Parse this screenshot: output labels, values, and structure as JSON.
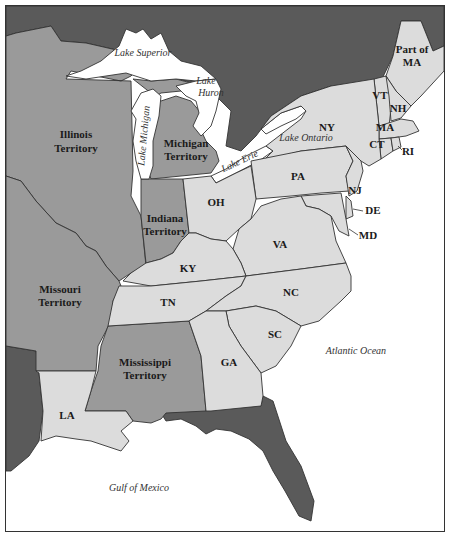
{
  "map": {
    "colors": {
      "foreign": "#5a5a5a",
      "territory": "#9a9a9a",
      "state": "#dcdcdc",
      "water": "#ffffff",
      "border": "#333333"
    },
    "territories": [
      {
        "id": "illinois",
        "label_line1": "Illinois",
        "label_line2": "Territory"
      },
      {
        "id": "michigan",
        "label_line1": "Michigan",
        "label_line2": "Territory"
      },
      {
        "id": "indiana",
        "label_line1": "Indiana",
        "label_line2": "Territory"
      },
      {
        "id": "missouri",
        "label_line1": "Missouri",
        "label_line2": "Territory"
      },
      {
        "id": "mississippi",
        "label_line1": "Mississippi",
        "label_line2": "Territory"
      }
    ],
    "states": [
      {
        "id": "maine",
        "label_line1": "Part of",
        "label_line2": "MA"
      },
      {
        "id": "vt",
        "label": "VT"
      },
      {
        "id": "nh",
        "label": "NH"
      },
      {
        "id": "ma",
        "label": "MA"
      },
      {
        "id": "ct",
        "label": "CT"
      },
      {
        "id": "ri",
        "label": "RI"
      },
      {
        "id": "ny",
        "label": "NY"
      },
      {
        "id": "pa",
        "label": "PA"
      },
      {
        "id": "nj",
        "label": "NJ"
      },
      {
        "id": "de",
        "label": "DE"
      },
      {
        "id": "md",
        "label": "MD"
      },
      {
        "id": "oh",
        "label": "OH"
      },
      {
        "id": "va",
        "label": "VA"
      },
      {
        "id": "ky",
        "label": "KY"
      },
      {
        "id": "tn",
        "label": "TN"
      },
      {
        "id": "nc",
        "label": "NC"
      },
      {
        "id": "sc",
        "label": "SC"
      },
      {
        "id": "ga",
        "label": "GA"
      },
      {
        "id": "la",
        "label": "LA"
      }
    ],
    "water_labels": {
      "lake_superior": "Lake Superior",
      "lake_huron_1": "Lake",
      "lake_huron_2": "Huron",
      "lake_michigan": "Lake Michigan",
      "lake_erie": "Lake Erie",
      "lake_ontario": "Lake Ontario",
      "atlantic": "Atlantic Ocean",
      "gulf": "Gulf of Mexico"
    }
  }
}
